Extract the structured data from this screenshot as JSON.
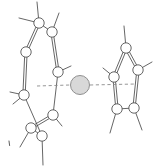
{
  "figure": {
    "background_color": "#ffffff",
    "line_color": "#4a4a4a",
    "atom_fill": "#ffffff",
    "atom_stroke": "#4a4a4a",
    "sphere_fill": "#d8d8d8",
    "sphere_stroke": "#8f8f8f",
    "dashed_color": "#8a8a8a",
    "caption": ""
  },
  "corner_mark": {
    "name": "stray-tick-mark",
    "x": 9,
    "y": 141
  },
  "central_sphere": {
    "label": "",
    "cx": 80,
    "cy": 85,
    "r": 9.5
  },
  "dashed_bonds": [
    {
      "name": "dashed-bond-left",
      "x1": 37,
      "y1": 86,
      "x2": 70,
      "y2": 85
    },
    {
      "name": "dashed-bond-right",
      "x1": 90,
      "y1": 85,
      "x2": 136,
      "y2": 84
    }
  ],
  "left_ring": {
    "name": "six-membered-ring",
    "atom_radius": 5.2,
    "atoms": [
      {
        "id": "L1",
        "cx": 39,
        "cy": 23
      },
      {
        "id": "L2",
        "cx": 52,
        "cy": 32
      },
      {
        "id": "L3",
        "cx": 58,
        "cy": 72
      },
      {
        "id": "L4",
        "cx": 53,
        "cy": 115
      },
      {
        "id": "L5",
        "cx": 31,
        "cy": 128
      },
      {
        "id": "L6",
        "cx": 42,
        "cy": 136
      },
      {
        "id": "L7",
        "cx": 24,
        "cy": 95
      },
      {
        "id": "L8",
        "cx": 26,
        "cy": 52
      }
    ],
    "bonds": [
      {
        "from": "L8",
        "to": "L1",
        "order": 2
      },
      {
        "from": "L1",
        "to": "L2",
        "order": 1
      },
      {
        "from": "L2",
        "to": "L3",
        "order": 2
      },
      {
        "from": "L3",
        "to": "L4",
        "order": 1
      },
      {
        "from": "L4",
        "to": "L5",
        "order": 2
      },
      {
        "from": "L5",
        "to": "L6",
        "order": 1
      },
      {
        "from": "L6",
        "to": "L7",
        "order": 1
      },
      {
        "from": "L7",
        "to": "L8",
        "order": 2
      }
    ],
    "substituents": [
      {
        "from": "L1",
        "x2": 37,
        "y2": 2
      },
      {
        "from": "L1",
        "x2": 19,
        "y2": 18
      },
      {
        "from": "L2",
        "x2": 59,
        "y2": 13
      },
      {
        "from": "L3",
        "x2": 71,
        "y2": 66
      },
      {
        "from": "L7",
        "x2": 10,
        "y2": 92
      },
      {
        "from": "L7",
        "x2": 13,
        "y2": 104
      },
      {
        "from": "L5",
        "x2": 20,
        "y2": 147
      },
      {
        "from": "L6",
        "x2": 43,
        "y2": 165
      },
      {
        "from": "L4",
        "x2": 62,
        "y2": 126
      }
    ]
  },
  "right_ring": {
    "name": "five-membered-ring",
    "atom_radius": 5.2,
    "atoms": [
      {
        "id": "R1",
        "cx": 126,
        "cy": 48
      },
      {
        "id": "R2",
        "cx": 138,
        "cy": 70
      },
      {
        "id": "R3",
        "cx": 134,
        "cy": 108
      },
      {
        "id": "R4",
        "cx": 117,
        "cy": 109
      },
      {
        "id": "R5",
        "cx": 114,
        "cy": 77
      }
    ],
    "bonds": [
      {
        "from": "R1",
        "to": "R2",
        "order": 2
      },
      {
        "from": "R2",
        "to": "R3",
        "order": 2
      },
      {
        "from": "R3",
        "to": "R4",
        "order": 1
      },
      {
        "from": "R4",
        "to": "R5",
        "order": 2
      },
      {
        "from": "R5",
        "to": "R1",
        "order": 2
      }
    ],
    "substituents": [
      {
        "from": "R1",
        "x2": 124,
        "y2": 26
      },
      {
        "from": "R2",
        "x2": 152,
        "y2": 62
      },
      {
        "from": "R5",
        "x2": 103,
        "y2": 68
      },
      {
        "from": "R3",
        "x2": 142,
        "y2": 130
      },
      {
        "from": "R4",
        "x2": 110,
        "y2": 133
      }
    ]
  }
}
